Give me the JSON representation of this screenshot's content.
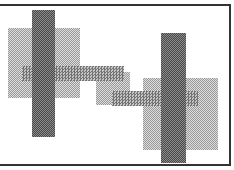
{
  "canvas": {
    "width": 234,
    "height": 170,
    "background": "#ffffff"
  },
  "frame": {
    "color": "#333333",
    "sides": [
      "top",
      "right",
      "bottom"
    ]
  },
  "shapes": [
    {
      "id": "left-light-rect",
      "x": 8,
      "y": 28,
      "w": 72,
      "h": 70,
      "tone": "light"
    },
    {
      "id": "middle-light-rect",
      "x": 96,
      "y": 72,
      "w": 34,
      "h": 33,
      "tone": "light"
    },
    {
      "id": "right-light-rect",
      "x": 143,
      "y": 78,
      "w": 75,
      "h": 72,
      "tone": "light"
    },
    {
      "id": "band-upper",
      "x": 22,
      "y": 66,
      "w": 102,
      "h": 15,
      "tone": "band"
    },
    {
      "id": "band-lower",
      "x": 112,
      "y": 91,
      "w": 86,
      "h": 15,
      "tone": "band"
    },
    {
      "id": "left-dark-bar",
      "x": 32,
      "y": 10,
      "w": 23,
      "h": 127,
      "tone": "dark"
    },
    {
      "id": "right-dark-bar",
      "x": 161,
      "y": 33,
      "w": 25,
      "h": 130,
      "tone": "dark"
    }
  ]
}
